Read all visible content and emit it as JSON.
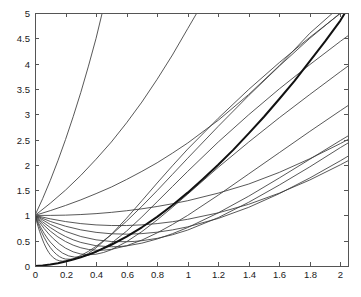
{
  "chart_data": {
    "type": "line",
    "title": "",
    "subtitle": "",
    "xlabel": "",
    "ylabel": "",
    "xlim": [
      0,
      2.05
    ],
    "ylim": [
      0,
      5
    ],
    "grid": false,
    "legend": null,
    "legend_position": "none",
    "background_color": "#ffffff",
    "axis_color": "#555555",
    "curve_color": "#3a3a3a",
    "envelope_color": "#111111",
    "xticks": [
      0,
      0.2,
      0.4,
      0.6,
      0.8,
      1,
      1.2,
      1.4,
      1.6,
      1.8,
      2
    ],
    "xticklabels": [
      "0",
      "0.2",
      "0.4",
      "0.6",
      "0.8",
      "1",
      "1.2",
      "1.4",
      "1.6",
      "1.8",
      "2"
    ],
    "yticks": [
      0,
      0.5,
      1,
      1.5,
      2,
      2.5,
      3,
      3.5,
      4,
      4.5,
      5
    ],
    "yticklabels": [
      "0",
      "0.5",
      "1",
      "1.5",
      "2",
      "2.5",
      "3",
      "3.5",
      "4",
      "4.5",
      "5"
    ],
    "common_point": [
      0,
      1
    ],
    "series": [
      {
        "name": "curve-1",
        "initial_slope": -12.0,
        "comment": "steepest descending, dives to y=0 near x=0.09",
        "points": [
          [
            0,
            1
          ],
          [
            0.01,
            0.886
          ],
          [
            0.02,
            0.781
          ],
          [
            0.03,
            0.684
          ],
          [
            0.04,
            0.595
          ],
          [
            0.05,
            0.514
          ],
          [
            0.06,
            0.441
          ],
          [
            0.07,
            0.376
          ],
          [
            0.08,
            0.319
          ],
          [
            0.09,
            0.269
          ],
          [
            0.1,
            0.227
          ],
          [
            0.12,
            0.164
          ],
          [
            0.14,
            0.124
          ],
          [
            0.16,
            0.103
          ],
          [
            0.18,
            0.096
          ],
          [
            0.2,
            0.102
          ],
          [
            0.25,
            0.143
          ],
          [
            0.3,
            0.207
          ],
          [
            0.35,
            0.29
          ],
          [
            0.4,
            0.388
          ],
          [
            0.5,
            0.62
          ],
          [
            0.6,
            0.887
          ],
          [
            0.7,
            1.18
          ],
          [
            0.8,
            1.49
          ],
          [
            0.9,
            1.81
          ],
          [
            1.0,
            2.13
          ],
          [
            1.2,
            2.76
          ],
          [
            1.4,
            3.37
          ],
          [
            1.6,
            3.95
          ],
          [
            1.8,
            4.5
          ],
          [
            2.0,
            5.0
          ],
          [
            2.05,
            5.0
          ]
        ]
      },
      {
        "name": "curve-2",
        "initial_slope": -9.0,
        "points": [
          [
            0,
            1
          ],
          [
            0.02,
            0.835
          ],
          [
            0.04,
            0.69
          ],
          [
            0.06,
            0.564
          ],
          [
            0.08,
            0.456
          ],
          [
            0.1,
            0.365
          ],
          [
            0.12,
            0.29
          ],
          [
            0.14,
            0.231
          ],
          [
            0.16,
            0.186
          ],
          [
            0.18,
            0.155
          ],
          [
            0.2,
            0.137
          ],
          [
            0.25,
            0.132
          ],
          [
            0.3,
            0.172
          ],
          [
            0.35,
            0.25
          ],
          [
            0.4,
            0.358
          ],
          [
            0.5,
            0.625
          ],
          [
            0.6,
            0.945
          ],
          [
            0.7,
            1.29
          ],
          [
            0.8,
            1.64
          ],
          [
            0.9,
            1.98
          ],
          [
            1.0,
            2.31
          ],
          [
            1.2,
            2.92
          ],
          [
            1.4,
            3.49
          ],
          [
            1.6,
            4.02
          ],
          [
            1.8,
            4.52
          ],
          [
            2.0,
            4.99
          ],
          [
            2.05,
            5.0
          ]
        ]
      },
      {
        "name": "curve-3",
        "initial_slope": -7.0,
        "points": [
          [
            0,
            1
          ],
          [
            0.02,
            0.868
          ],
          [
            0.04,
            0.75
          ],
          [
            0.06,
            0.645
          ],
          [
            0.08,
            0.553
          ],
          [
            0.1,
            0.473
          ],
          [
            0.14,
            0.346
          ],
          [
            0.18,
            0.256
          ],
          [
            0.22,
            0.2
          ],
          [
            0.26,
            0.175
          ],
          [
            0.3,
            0.18
          ],
          [
            0.35,
            0.214
          ],
          [
            0.4,
            0.272
          ],
          [
            0.5,
            0.45
          ],
          [
            0.6,
            0.69
          ],
          [
            0.7,
            0.97
          ],
          [
            0.8,
            1.27
          ],
          [
            0.9,
            1.57
          ],
          [
            1.0,
            1.87
          ],
          [
            1.2,
            2.45
          ],
          [
            1.4,
            2.99
          ],
          [
            1.6,
            3.5
          ],
          [
            1.8,
            3.98
          ],
          [
            2.0,
            4.44
          ],
          [
            2.05,
            4.55
          ]
        ]
      },
      {
        "name": "curve-4",
        "initial_slope": -5.2,
        "points": [
          [
            0,
            1
          ],
          [
            0.03,
            0.862
          ],
          [
            0.06,
            0.74
          ],
          [
            0.09,
            0.633
          ],
          [
            0.12,
            0.54
          ],
          [
            0.16,
            0.436
          ],
          [
            0.2,
            0.353
          ],
          [
            0.25,
            0.28
          ],
          [
            0.3,
            0.237
          ],
          [
            0.35,
            0.222
          ],
          [
            0.4,
            0.233
          ],
          [
            0.45,
            0.268
          ],
          [
            0.5,
            0.322
          ],
          [
            0.6,
            0.48
          ],
          [
            0.7,
            0.68
          ],
          [
            0.8,
            0.91
          ],
          [
            0.9,
            1.16
          ],
          [
            1.0,
            1.42
          ],
          [
            1.2,
            1.95
          ],
          [
            1.4,
            2.45
          ],
          [
            1.6,
            2.93
          ],
          [
            1.8,
            3.39
          ],
          [
            2.0,
            3.84
          ],
          [
            2.05,
            3.95
          ]
        ]
      },
      {
        "name": "curve-5",
        "initial_slope": -3.8,
        "points": [
          [
            0,
            1
          ],
          [
            0.05,
            0.83
          ],
          [
            0.1,
            0.69
          ],
          [
            0.15,
            0.575
          ],
          [
            0.2,
            0.483
          ],
          [
            0.25,
            0.412
          ],
          [
            0.3,
            0.36
          ],
          [
            0.35,
            0.327
          ],
          [
            0.4,
            0.312
          ],
          [
            0.45,
            0.313
          ],
          [
            0.5,
            0.329
          ],
          [
            0.6,
            0.4
          ],
          [
            0.7,
            0.512
          ],
          [
            0.8,
            0.655
          ],
          [
            0.9,
            0.82
          ],
          [
            1.0,
            1.0
          ],
          [
            1.2,
            1.4
          ],
          [
            1.4,
            1.82
          ],
          [
            1.6,
            2.24
          ],
          [
            1.8,
            2.66
          ],
          [
            2.0,
            3.07
          ],
          [
            2.05,
            3.17
          ]
        ]
      },
      {
        "name": "curve-6",
        "initial_slope": -2.8,
        "points": [
          [
            0,
            1
          ],
          [
            0.05,
            0.872
          ],
          [
            0.1,
            0.76
          ],
          [
            0.15,
            0.664
          ],
          [
            0.2,
            0.583
          ],
          [
            0.25,
            0.517
          ],
          [
            0.3,
            0.466
          ],
          [
            0.4,
            0.4
          ],
          [
            0.5,
            0.38
          ],
          [
            0.55,
            0.384
          ],
          [
            0.6,
            0.397
          ],
          [
            0.7,
            0.452
          ],
          [
            0.8,
            0.534
          ],
          [
            0.9,
            0.638
          ],
          [
            1.0,
            0.76
          ],
          [
            1.2,
            1.05
          ],
          [
            1.4,
            1.38
          ],
          [
            1.6,
            1.74
          ],
          [
            1.8,
            2.11
          ],
          [
            2.0,
            2.48
          ],
          [
            2.05,
            2.57
          ]
        ]
      },
      {
        "name": "curve-7",
        "initial_slope": -2.0,
        "points": [
          [
            0,
            1
          ],
          [
            0.1,
            0.823
          ],
          [
            0.2,
            0.684
          ],
          [
            0.3,
            0.583
          ],
          [
            0.4,
            0.517
          ],
          [
            0.5,
            0.484
          ],
          [
            0.6,
            0.48
          ],
          [
            0.65,
            0.486
          ],
          [
            0.7,
            0.5
          ],
          [
            0.8,
            0.546
          ],
          [
            0.9,
            0.617
          ],
          [
            1.0,
            0.71
          ],
          [
            1.2,
            0.956
          ],
          [
            1.4,
            1.26
          ],
          [
            1.6,
            1.6
          ],
          [
            1.8,
            1.96
          ],
          [
            2.0,
            2.34
          ],
          [
            2.05,
            2.43
          ]
        ]
      },
      {
        "name": "curve-8",
        "initial_slope": -1.3,
        "points": [
          [
            0,
            1
          ],
          [
            0.1,
            0.881
          ],
          [
            0.2,
            0.786
          ],
          [
            0.3,
            0.714
          ],
          [
            0.4,
            0.665
          ],
          [
            0.5,
            0.637
          ],
          [
            0.6,
            0.629
          ],
          [
            0.7,
            0.64
          ],
          [
            0.8,
            0.668
          ],
          [
            0.9,
            0.713
          ],
          [
            1.0,
            0.774
          ],
          [
            1.2,
            0.94
          ],
          [
            1.4,
            1.16
          ],
          [
            1.6,
            1.43
          ],
          [
            1.8,
            1.74
          ],
          [
            2.0,
            2.08
          ],
          [
            2.05,
            2.17
          ]
        ]
      },
      {
        "name": "curve-9",
        "initial_slope": -0.75,
        "points": [
          [
            0,
            1
          ],
          [
            0.1,
            0.932
          ],
          [
            0.2,
            0.878
          ],
          [
            0.3,
            0.838
          ],
          [
            0.4,
            0.812
          ],
          [
            0.5,
            0.8
          ],
          [
            0.6,
            0.8
          ],
          [
            0.7,
            0.813
          ],
          [
            0.8,
            0.838
          ],
          [
            0.9,
            0.875
          ],
          [
            1.0,
            0.923
          ],
          [
            1.2,
            1.05
          ],
          [
            1.4,
            1.22
          ],
          [
            1.6,
            1.44
          ],
          [
            1.8,
            1.7
          ],
          [
            2.0,
            2.0
          ],
          [
            2.05,
            2.08
          ]
        ]
      },
      {
        "name": "curve-10",
        "initial_slope": -0.1,
        "points": [
          [
            0,
            1
          ],
          [
            0.1,
            1.0
          ],
          [
            0.2,
            1.005
          ],
          [
            0.3,
            1.017
          ],
          [
            0.4,
            1.035
          ],
          [
            0.5,
            1.06
          ],
          [
            0.6,
            1.092
          ],
          [
            0.7,
            1.13
          ],
          [
            0.8,
            1.176
          ],
          [
            0.9,
            1.23
          ],
          [
            1.0,
            1.29
          ],
          [
            1.2,
            1.44
          ],
          [
            1.4,
            1.62
          ],
          [
            1.6,
            1.85
          ],
          [
            1.8,
            2.12
          ],
          [
            2.0,
            2.42
          ],
          [
            2.05,
            2.5
          ]
        ]
      },
      {
        "name": "curve-11",
        "initial_slope": 0.9,
        "points": [
          [
            0,
            1
          ],
          [
            0.1,
            1.094
          ],
          [
            0.2,
            1.196
          ],
          [
            0.3,
            1.307
          ],
          [
            0.4,
            1.43
          ],
          [
            0.5,
            1.56
          ],
          [
            0.6,
            1.71
          ],
          [
            0.7,
            1.87
          ],
          [
            0.8,
            2.04
          ],
          [
            0.9,
            2.23
          ],
          [
            1.0,
            2.43
          ],
          [
            1.2,
            2.88
          ],
          [
            1.4,
            3.39
          ],
          [
            1.6,
            3.96
          ],
          [
            1.8,
            4.6
          ],
          [
            1.95,
            5.0
          ]
        ]
      },
      {
        "name": "curve-12",
        "initial_slope": 2.3,
        "points": [
          [
            0,
            1
          ],
          [
            0.1,
            1.24
          ],
          [
            0.2,
            1.5
          ],
          [
            0.3,
            1.79
          ],
          [
            0.4,
            2.11
          ],
          [
            0.5,
            2.45
          ],
          [
            0.6,
            2.83
          ],
          [
            0.7,
            3.24
          ],
          [
            0.8,
            3.69
          ],
          [
            0.9,
            4.17
          ],
          [
            1.0,
            4.69
          ],
          [
            1.06,
            5.0
          ]
        ]
      },
      {
        "name": "curve-13",
        "initial_slope": 6.5,
        "points": [
          [
            0,
            1
          ],
          [
            0.05,
            1.33
          ],
          [
            0.1,
            1.69
          ],
          [
            0.15,
            2.08
          ],
          [
            0.2,
            2.5
          ],
          [
            0.25,
            2.95
          ],
          [
            0.3,
            3.43
          ],
          [
            0.35,
            3.95
          ],
          [
            0.4,
            4.5
          ],
          [
            0.44,
            5.0
          ]
        ]
      },
      {
        "name": "envelope",
        "initial_slope": 0,
        "is_envelope": true,
        "line_width": 2.0,
        "comment": "thick singular solution from the origin, approached from above by lower curves",
        "points": [
          [
            0,
            0
          ],
          [
            0.05,
            0.012
          ],
          [
            0.1,
            0.03
          ],
          [
            0.15,
            0.055
          ],
          [
            0.2,
            0.088
          ],
          [
            0.25,
            0.127
          ],
          [
            0.3,
            0.172
          ],
          [
            0.35,
            0.224
          ],
          [
            0.4,
            0.283
          ],
          [
            0.5,
            0.42
          ],
          [
            0.6,
            0.58
          ],
          [
            0.7,
            0.765
          ],
          [
            0.8,
            0.97
          ],
          [
            0.9,
            1.2
          ],
          [
            1.0,
            1.45
          ],
          [
            1.1,
            1.72
          ],
          [
            1.2,
            2.0
          ],
          [
            1.3,
            2.3
          ],
          [
            1.4,
            2.62
          ],
          [
            1.5,
            2.95
          ],
          [
            1.6,
            3.3
          ],
          [
            1.7,
            3.66
          ],
          [
            1.8,
            4.05
          ],
          [
            1.9,
            4.44
          ],
          [
            2.0,
            4.85
          ],
          [
            2.03,
            5.0
          ]
        ]
      }
    ]
  },
  "figure": {
    "plot_left_px": 35,
    "plot_top_px": 13,
    "plot_right_px": 348,
    "plot_bottom_px": 266
  }
}
